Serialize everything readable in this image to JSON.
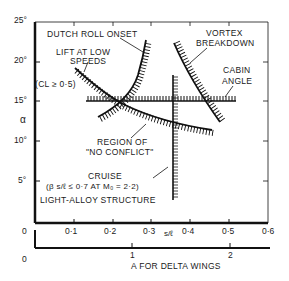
{
  "diagram": {
    "type": "design-constraint chart",
    "y_axis": {
      "symbol": "α",
      "ticks": [
        "25°",
        "20°",
        "15°",
        "10°",
        "5°",
        "0"
      ]
    },
    "x_axis_primary": {
      "label": "s/ℓ",
      "ticks": [
        "0",
        "0·1",
        "0·2",
        "0·3",
        "0·4",
        "0·5",
        "0·6"
      ]
    },
    "x_axis_secondary": {
      "label": "A FOR DELTA WINGS",
      "ticks": [
        "0",
        "1",
        "2"
      ]
    },
    "annotations": {
      "dutch_roll": "DUTCH ROLL ONSET",
      "lift_line1": "LIFT AT LOW",
      "lift_line2": "SPEEDS",
      "cl_condition": "(CL ≥ 0·5)",
      "vortex_line1": "VORTEX",
      "vortex_line2": "BREAKDOWN",
      "cabin_line1": "CABIN",
      "cabin_line2": "ANGLE",
      "region_line1": "REGION OF",
      "region_line2": "\"NO CONFLICT\"",
      "cruise_line1": "CRUISE",
      "cruise_line2": "(β s/ℓ ≤ 0·7 AT M₀ = 2·2)",
      "structure": "LIGHT-ALLOY STRUCTURE"
    }
  }
}
